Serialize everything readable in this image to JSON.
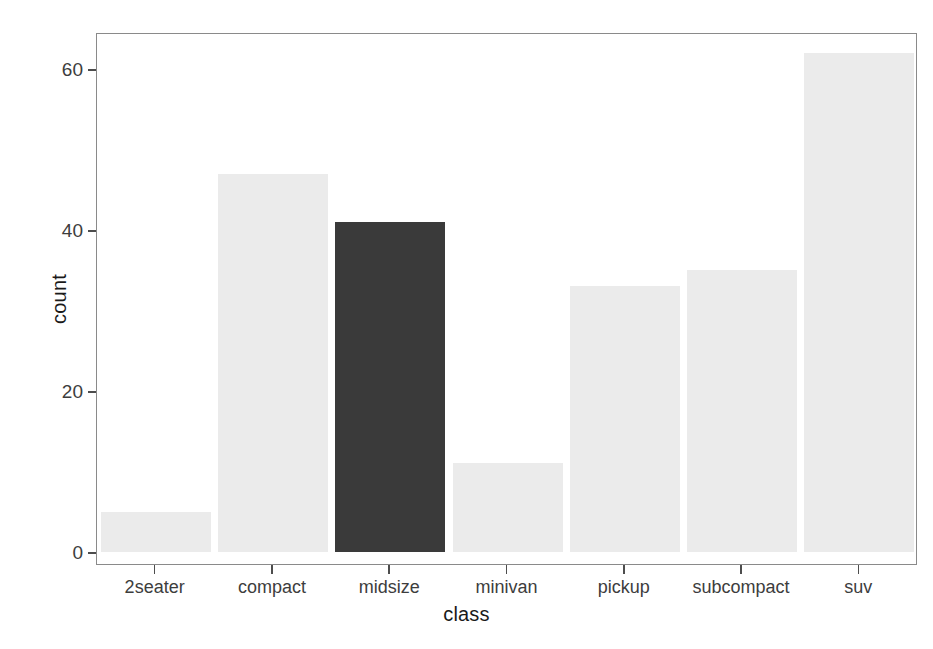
{
  "chart_data": {
    "type": "bar",
    "title": "",
    "subtitle": "",
    "xlabel": "class",
    "ylabel": "count",
    "categories": [
      "2seater",
      "compact",
      "midsize",
      "minivan",
      "pickup",
      "subcompact",
      "suv"
    ],
    "values": [
      5,
      47,
      41,
      11,
      33,
      35,
      62
    ],
    "bar_colors": [
      "#ebebeb",
      "#ebebeb",
      "#3a3a3a",
      "#ebebeb",
      "#ebebeb",
      "#ebebeb",
      "#ebebeb"
    ],
    "highlighted_category": "midsize",
    "ylim": [
      0,
      66
    ],
    "y_ticks": [
      0,
      20,
      40,
      60
    ],
    "y_tick_labels": [
      "0",
      "20",
      "40",
      "60"
    ],
    "x_tick_labels": [
      "2seater",
      "compact",
      "midsize",
      "minivan",
      "pickup",
      "subcompact",
      "suv"
    ],
    "grid": false,
    "legend": "none",
    "panel_background": "#ffffff",
    "panel_border_color": "#8a8a8a",
    "axis_text_color": "#3d3d3d"
  },
  "axes": {
    "x_title": "class",
    "y_title": "count"
  }
}
